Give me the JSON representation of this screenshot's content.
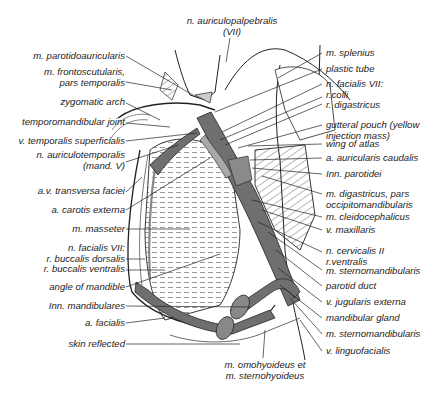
{
  "diagram": {
    "type": "anatomical illustration",
    "colors": {
      "vessel_dark": "#6f6f6f",
      "vessel_light": "#a8a8a8",
      "line": "#222222",
      "background": "#ffffff"
    }
  },
  "labels": {
    "top": [
      {
        "id": "n_auriculopalpebralis",
        "lines": [
          "n. auriculopalpebralis",
          "(VII)"
        ]
      }
    ],
    "left": [
      {
        "id": "m_parotidoauricularis",
        "lines": [
          "m. parotidoauricularis"
        ]
      },
      {
        "id": "m_frontoscutularis",
        "lines": [
          "m. frontoscutularis,",
          "pars temporalis"
        ]
      },
      {
        "id": "zygomatic_arch",
        "lines": [
          "zygomatic arch"
        ]
      },
      {
        "id": "temporomandibular_joint",
        "lines": [
          "temporomandibular joint"
        ]
      },
      {
        "id": "v_temporalis_superficialis",
        "lines": [
          "v. temporalis superficialis"
        ]
      },
      {
        "id": "n_auriculotemporalis",
        "lines": [
          "n. auriculotemporalis",
          "(mand. V)"
        ]
      },
      {
        "id": "av_transversa_faciei",
        "lines": [
          "a.v. transversa faciei"
        ]
      },
      {
        "id": "a_carotis_externa",
        "lines": [
          "a. carotis externa"
        ]
      },
      {
        "id": "m_masseter",
        "lines": [
          "m. masseter"
        ]
      },
      {
        "id": "n_facialis_buccal",
        "lines": [
          "n. facialis VII:",
          "r. buccalis dorsalis",
          "r. buccalis ventralis"
        ]
      },
      {
        "id": "angle_of_mandible",
        "lines": [
          "angle of mandible"
        ]
      },
      {
        "id": "lnn_mandibulares",
        "lines": [
          "Inn. mandibulares"
        ]
      },
      {
        "id": "a_facialis",
        "lines": [
          "a. facialis"
        ]
      },
      {
        "id": "skin_reflected",
        "lines": [
          "skin reflected"
        ]
      }
    ],
    "right": [
      {
        "id": "m_splenius",
        "lines": [
          "m. splenius"
        ]
      },
      {
        "id": "plastic_tube",
        "lines": [
          "plastic tube"
        ]
      },
      {
        "id": "n_facialis_colli",
        "lines": [
          "n. facialis VII:",
          "r.colli",
          "r. digastricus"
        ]
      },
      {
        "id": "gutteral_pouch",
        "lines": [
          "gutteral pouch (yellow",
          "injection mass)"
        ]
      },
      {
        "id": "wing_of_atlas",
        "lines": [
          "wing of atlas"
        ]
      },
      {
        "id": "a_auricularis_caudalis",
        "lines": [
          "a. auricularis caudalis"
        ]
      },
      {
        "id": "lnn_parotidei",
        "lines": [
          "Inn. parotidei"
        ]
      },
      {
        "id": "m_digastricus",
        "lines": [
          "m. digastricus, pars",
          "occipitomandibularis"
        ]
      },
      {
        "id": "m_cleidocephalicus",
        "lines": [
          "m. cleidocephalicus"
        ]
      },
      {
        "id": "v_maxillaris",
        "lines": [
          "v. maxillaris"
        ]
      },
      {
        "id": "n_cervicalis_ii",
        "lines": [
          "n. cervicalis II",
          "r.ventralis"
        ]
      },
      {
        "id": "m_sternomandibularis_1",
        "lines": [
          "m. sternomandibularis"
        ]
      },
      {
        "id": "parotid_duct",
        "lines": [
          "parotid duct"
        ]
      },
      {
        "id": "v_jugularis_externa",
        "lines": [
          "v. jugularis externa"
        ]
      },
      {
        "id": "mandibular_gland",
        "lines": [
          "mandibular gland"
        ]
      },
      {
        "id": "m_sternomandibularis_2",
        "lines": [
          "m. sternomandibularis"
        ]
      },
      {
        "id": "v_linguofacialis",
        "lines": [
          "v. linguofacialis"
        ]
      }
    ],
    "bottom": [
      {
        "id": "m_omohyoideus",
        "lines": [
          "m. omohyoideus et",
          "m. sternohyoideus"
        ]
      }
    ]
  }
}
